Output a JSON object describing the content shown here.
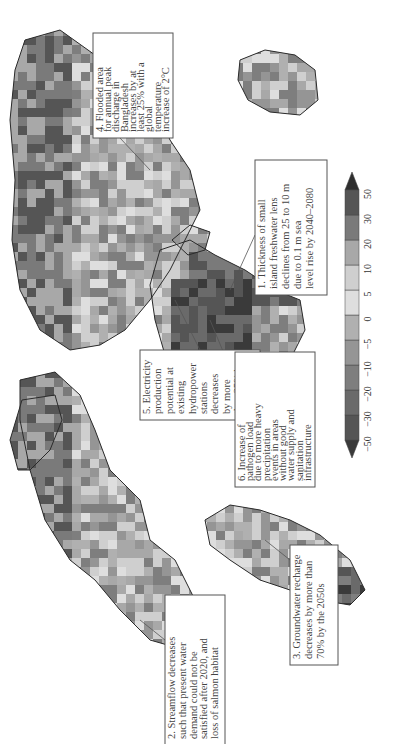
{
  "figure": {
    "type": "world map",
    "orientation": "rotated 90 degrees (landscape page shown in portrait)",
    "legend": {
      "ticks": [
        "−50",
        "−30",
        "−20",
        "−10",
        "−5",
        "0",
        "5",
        "10",
        "20",
        "30",
        "50"
      ],
      "bins": [
        {
          "range": "< −50",
          "color": "#3a3a3a"
        },
        {
          "range": "−50 to −30",
          "color": "#555555"
        },
        {
          "range": "−30 to −20",
          "color": "#6a6a6a"
        },
        {
          "range": "−20 to −10",
          "color": "#7e7e7e"
        },
        {
          "range": "−10 to −5",
          "color": "#959595"
        },
        {
          "range": "−5 to 0",
          "color": "#b0b0b0"
        },
        {
          "range": "0 to 5",
          "color": "#dedede"
        },
        {
          "range": "5 to 10",
          "color": "#cfcfcf"
        },
        {
          "range": "10 to 20",
          "color": "#a8a8a8"
        },
        {
          "range": "20 to 30",
          "color": "#7a7a7a"
        },
        {
          "range": "30 to 50",
          "color": "#555555"
        },
        {
          "range": "> 50",
          "color": "#2e2e2e"
        }
      ]
    },
    "annotations": [
      {
        "id": 1,
        "lines": [
          "1. Thickness of small",
          "island freshwater lens",
          "declines from 25 to 10 m",
          "due to 0.1 m sea",
          "level rise by 2040–2080"
        ]
      },
      {
        "id": 2,
        "lines": [
          "2. Streamflow decreases",
          "such that present water",
          "demand could not be",
          "satisfied after 2020, and",
          "loss of salmon habitat"
        ]
      },
      {
        "id": 3,
        "lines": [
          "3. Groundwater recharge",
          "decreases by more than",
          "70% by the 2050s"
        ]
      },
      {
        "id": 4,
        "lines": [
          "4. Flooded area",
          "for annual peak",
          "discharge in",
          "Bangladesh",
          "increases by at",
          "least 25% with a",
          "global",
          "temperature",
          "increase of 2°C"
        ]
      },
      {
        "id": 5,
        "lines": [
          "5. Electricity",
          "production",
          "potential at",
          "existing",
          "hydropower",
          "stations",
          "decreases",
          "by more",
          "than 25% by",
          "the 2070s"
        ]
      },
      {
        "id": 6,
        "lines": [
          "6. Increase of",
          "pathogen load",
          "due to more heavy",
          "precipitation",
          "events in areas",
          "without good",
          "water supply and",
          "sanitation",
          "infrastructure"
        ]
      }
    ]
  }
}
